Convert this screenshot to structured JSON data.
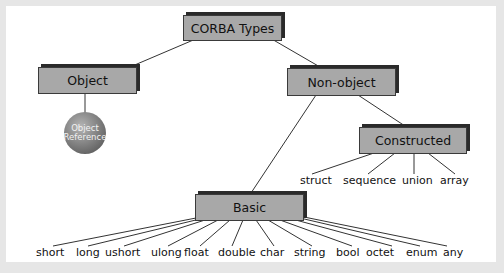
{
  "diagram": {
    "root": {
      "label": "CORBA Types"
    },
    "object": {
      "label": "Object"
    },
    "object_reference": {
      "line1": "Object",
      "line2": "Reference"
    },
    "non_object": {
      "label": "Non-object"
    },
    "constructed": {
      "label": "Constructed",
      "children": [
        "struct",
        "sequence",
        "union",
        "array"
      ]
    },
    "basic": {
      "label": "Basic",
      "children": [
        "short",
        "long",
        "ushort",
        "ulong",
        "float",
        "double",
        "char",
        "string",
        "bool",
        "octet",
        "enum",
        "any"
      ]
    }
  }
}
